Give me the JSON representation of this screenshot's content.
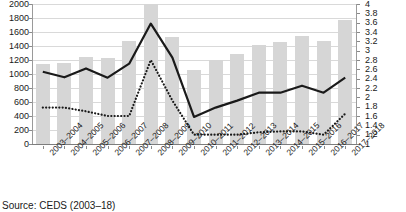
{
  "chart_data": {
    "type": "bar",
    "title": "",
    "subtitle": "",
    "xlabel": "",
    "ylabel": "",
    "grid": true,
    "legend": "none",
    "categories": [
      "2003–2004",
      "2004–2005",
      "2005–2006",
      "2006–2007",
      "2007–2008",
      "2008–2009",
      "2009–2010",
      "2010–2011",
      "2011–2012",
      "2012–2013",
      "2013–2014",
      "2014–2015",
      "2015–2016",
      "2016–2017",
      "2017–2018"
    ],
    "axes": {
      "left": {
        "min": 0,
        "max": 2000,
        "step": 200,
        "ticks": [
          "0",
          "200",
          "400",
          "600",
          "800",
          "1000",
          "1200",
          "1400",
          "1600",
          "1800",
          "2000"
        ]
      },
      "right": {
        "min": 1,
        "max": 4,
        "step": 0.2,
        "ticks": [
          "1",
          "1.2",
          "1.4",
          "1.6",
          "1.8",
          "2",
          "2.2",
          "2.4",
          "2.6",
          "2.8",
          "3",
          "3.2",
          "3.4",
          "3.6",
          "3.8",
          "4"
        ]
      }
    },
    "series": [
      {
        "name": "bars",
        "render": "bar",
        "axis": "left",
        "color": "#d6d6d6",
        "clipped_at_max": [
          false,
          false,
          false,
          false,
          false,
          true,
          false,
          false,
          false,
          false,
          false,
          false,
          false,
          false,
          false
        ],
        "values": [
          1140,
          1165,
          1240,
          1235,
          1475,
          2000,
          1530,
          1060,
          1195,
          1290,
          1410,
          1455,
          1540,
          1475,
          1775
        ]
      },
      {
        "name": "solid-line",
        "render": "line",
        "style": "solid",
        "axis": "right",
        "color": "#1a1a1a",
        "values": [
          2.55,
          2.43,
          2.62,
          2.42,
          2.72,
          3.58,
          2.85,
          1.58,
          1.78,
          1.93,
          2.1,
          2.1,
          2.25,
          2.1,
          2.42
        ]
      },
      {
        "name": "dotted-line",
        "render": "line",
        "style": "dotted",
        "axis": "right",
        "color": "#1a1a1a",
        "values": [
          1.78,
          1.78,
          1.7,
          1.6,
          1.6,
          2.8,
          1.93,
          1.2,
          1.2,
          1.2,
          1.25,
          1.27,
          1.27,
          1.2,
          1.65
        ]
      }
    ]
  },
  "footer": {
    "source": "Source: CEDS (2003–18)"
  },
  "colors": {
    "bar": "#d6d6d6",
    "line": "#1a1a1a",
    "grid": "#d9d9d9",
    "axis": "#8a8a8a",
    "text": "#1a1a1a",
    "background": "#ffffff"
  }
}
